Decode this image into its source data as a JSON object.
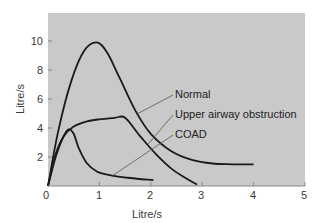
{
  "chart_data": {
    "type": "line",
    "title": "",
    "xlabel": "Litre/s",
    "ylabel": "Litre/s",
    "xlim": [
      0,
      5
    ],
    "ylim": [
      0,
      12
    ],
    "x_ticks": [
      "0",
      "1",
      "2",
      "3",
      "4",
      "5"
    ],
    "y_ticks": [
      "2",
      "4",
      "6",
      "8",
      "10"
    ],
    "grid": false,
    "legend": "inline leader-line labels, right side",
    "plot_background": "#c9c9c9",
    "series": [
      {
        "name": "Normal",
        "color": "#1a1a1a",
        "points": [
          [
            0,
            0
          ],
          [
            0.2,
            3.8
          ],
          [
            0.45,
            7.2
          ],
          [
            0.7,
            9.3
          ],
          [
            0.95,
            9.9
          ],
          [
            1.15,
            9.2
          ],
          [
            1.4,
            7.4
          ],
          [
            1.7,
            5.2
          ],
          [
            2.0,
            3.6
          ],
          [
            2.4,
            2.4
          ],
          [
            2.8,
            1.8
          ],
          [
            3.2,
            1.55
          ],
          [
            3.6,
            1.5
          ],
          [
            4.0,
            1.5
          ]
        ],
        "label_anchor": [
          1.75,
          5.0
        ]
      },
      {
        "name": "Upper airway obstruction",
        "color": "#1a1a1a",
        "points": [
          [
            0,
            0
          ],
          [
            0.15,
            2.2
          ],
          [
            0.3,
            3.4
          ],
          [
            0.5,
            4.1
          ],
          [
            0.75,
            4.45
          ],
          [
            1.0,
            4.6
          ],
          [
            1.3,
            4.7
          ],
          [
            1.5,
            4.7
          ],
          [
            1.8,
            3.4
          ],
          [
            2.1,
            2.2
          ],
          [
            2.4,
            1.2
          ],
          [
            2.7,
            0.5
          ],
          [
            2.9,
            0.1
          ]
        ],
        "label_anchor": [
          1.95,
          2.9
        ]
      },
      {
        "name": "COAD",
        "color": "#1a1a1a",
        "points": [
          [
            0,
            0
          ],
          [
            0.15,
            2.0
          ],
          [
            0.3,
            3.4
          ],
          [
            0.4,
            3.9
          ],
          [
            0.5,
            3.6
          ],
          [
            0.6,
            2.6
          ],
          [
            0.75,
            1.6
          ],
          [
            0.95,
            1.0
          ],
          [
            1.2,
            0.75
          ],
          [
            1.6,
            0.55
          ],
          [
            2.05,
            0.4
          ]
        ],
        "label_anchor": [
          1.25,
          0.7
        ]
      }
    ]
  },
  "labels": {
    "x_axis": "Litre/s",
    "y_axis": "Litre/s",
    "series_normal": "Normal",
    "series_uao": "Upper airway obstruction",
    "series_coad": "COAD",
    "x_ticks": [
      "0",
      "1",
      "2",
      "3",
      "4",
      "5"
    ],
    "y_ticks": [
      "2",
      "4",
      "6",
      "8",
      "10"
    ]
  }
}
